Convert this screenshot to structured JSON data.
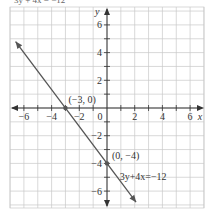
{
  "header": {
    "cut_text": "3y + 4x = −12"
  },
  "chart_data": {
    "type": "line",
    "title": "",
    "xlabel": "x",
    "ylabel": "y",
    "xlim": [
      -7,
      7
    ],
    "ylim": [
      -7.2,
      7.3
    ],
    "grid": true,
    "x_ticks": [
      -6,
      -4,
      -2,
      0,
      2,
      4,
      6
    ],
    "x_tick_labels": [
      "−6",
      "−4",
      "−2",
      "0",
      "2",
      "4",
      "6"
    ],
    "y_ticks": [
      -6,
      -4,
      -2,
      2,
      4,
      6
    ],
    "y_tick_labels": [
      "−6",
      "−4",
      "−2",
      "2",
      "4",
      "6"
    ],
    "series": [
      {
        "name": "3y+4x=−12",
        "equation": "3y + 4x = −12",
        "x": [
          -6.6,
          2.1
        ],
        "y": [
          4.8,
          -6.8
        ],
        "color": "#555555"
      }
    ],
    "points": [
      {
        "label": "(−3, 0)",
        "x": -3,
        "y": 0
      },
      {
        "label": "(0, −4)",
        "x": 0,
        "y": -4
      }
    ],
    "annotations": [
      {
        "text": "3y+4x=−12",
        "x": 0.7,
        "y": -5
      }
    ]
  }
}
